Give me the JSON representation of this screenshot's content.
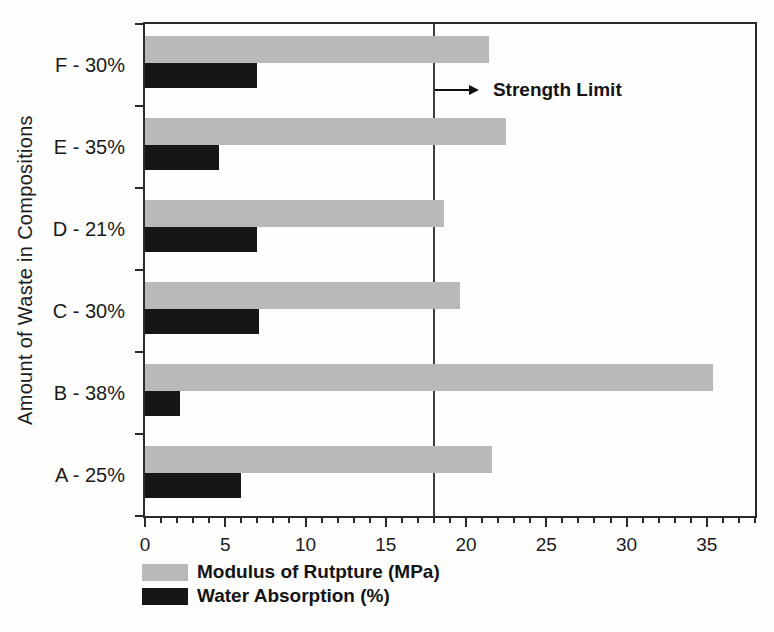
{
  "chart_data": {
    "type": "bar",
    "orientation": "horizontal",
    "title": "",
    "xlabel": "",
    "ylabel": "Amount of Waste in Compositions",
    "categories": [
      "F - 30%",
      "E - 35%",
      "D - 21%",
      "C - 30%",
      "B - 38%",
      "A - 25%"
    ],
    "series": [
      {
        "name": "Modulus of Rutpture (MPa)",
        "color": "#b9b9b7",
        "values": [
          21.4,
          22.5,
          18.6,
          19.6,
          35.4,
          21.6
        ]
      },
      {
        "name": "Water Absorption (%)",
        "color": "#161616",
        "values": [
          7.0,
          4.6,
          7.0,
          7.1,
          2.2,
          6.0
        ]
      }
    ],
    "xlim": [
      0,
      38
    ],
    "x_major_ticks": [
      0,
      5,
      10,
      15,
      20,
      25,
      30,
      35
    ],
    "x_minor_tick_step": 1,
    "grid": false,
    "legend_position": "bottom-left",
    "reference_line": {
      "x": 18,
      "color": "#3c3c3c"
    },
    "annotation": {
      "text": "Strength Limit",
      "x": 18
    }
  },
  "colors": {
    "frame": "#2a2a2a",
    "background": "#fdfdfc"
  }
}
